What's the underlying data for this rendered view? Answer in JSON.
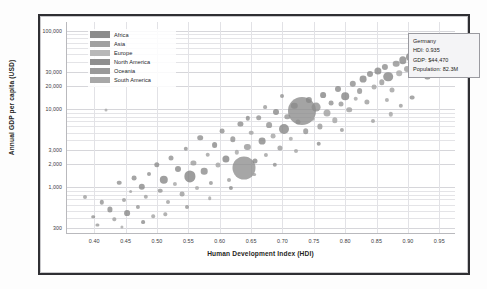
{
  "chart_data": {
    "type": "scatter",
    "title": "",
    "xlabel": "Human Development Index (HDI)",
    "ylabel": "Annual GDP per capita (USD)",
    "xlim": [
      0.355,
      0.975
    ],
    "ylim": [
      260,
      130000
    ],
    "yscale": "log",
    "xscale": "linear",
    "grid": true,
    "legend_position": "top-left-inside",
    "bubble_size_encodes": "Population",
    "xticks": [
      "0.40",
      "0.45",
      "0.50",
      "0.55",
      "0.60",
      "0.65",
      "0.70",
      "0.75",
      "0.80",
      "0.85",
      "0.90",
      "0.95"
    ],
    "xtick_values": [
      0.4,
      0.45,
      0.5,
      0.55,
      0.6,
      0.65,
      0.7,
      0.75,
      0.8,
      0.85,
      0.9,
      0.95
    ],
    "yticks": [
      "300",
      "1,000",
      "2,000",
      "3,000",
      "10,000",
      "20,000",
      "30,000",
      "100,000"
    ],
    "ytick_values": [
      300,
      1000,
      2000,
      3000,
      10000,
      20000,
      30000,
      100000
    ],
    "legend": [
      {
        "label": "Africa",
        "color": "#8c8c8c"
      },
      {
        "label": "Asia",
        "color": "#a0a0a0"
      },
      {
        "label": "Europe",
        "color": "#b8b8b8"
      },
      {
        "label": "North America",
        "color": "#8f8f8f"
      },
      {
        "label": "Oceania",
        "color": "#9a9a9a"
      },
      {
        "label": "South America",
        "color": "#a8a8a8"
      }
    ],
    "annotation": {
      "name": "Germany",
      "hdi_label": "HDI: 0.935",
      "gdp_label": "GDP: $44,470",
      "population_label": "Population: 82.3M",
      "hdi": 0.935,
      "gdp": 44470,
      "population": "82.3M"
    },
    "points": [
      {
        "x": 0.385,
        "y": 740,
        "r": 2.0,
        "c": "#9b9b9b"
      },
      {
        "x": 0.398,
        "y": 420,
        "r": 1.8,
        "c": "#8f8f8f"
      },
      {
        "x": 0.405,
        "y": 330,
        "r": 1.6,
        "c": "#979797"
      },
      {
        "x": 0.412,
        "y": 640,
        "r": 2.2,
        "c": "#909090"
      },
      {
        "x": 0.418,
        "y": 9800,
        "r": 1.5,
        "c": "#a6a6a6"
      },
      {
        "x": 0.425,
        "y": 520,
        "r": 2.6,
        "c": "#8a8a8a"
      },
      {
        "x": 0.432,
        "y": 390,
        "r": 1.7,
        "c": "#9d9d9d"
      },
      {
        "x": 0.44,
        "y": 1150,
        "r": 2.3,
        "c": "#8e8e8e"
      },
      {
        "x": 0.447,
        "y": 680,
        "r": 2.0,
        "c": "#999999"
      },
      {
        "x": 0.452,
        "y": 470,
        "r": 2.9,
        "c": "#858585"
      },
      {
        "x": 0.458,
        "y": 880,
        "r": 1.9,
        "c": "#a2a2a2"
      },
      {
        "x": 0.463,
        "y": 1320,
        "r": 2.4,
        "c": "#8c8c8c"
      },
      {
        "x": 0.47,
        "y": 560,
        "r": 2.1,
        "c": "#949494"
      },
      {
        "x": 0.476,
        "y": 1020,
        "r": 3.2,
        "c": "#888888"
      },
      {
        "x": 0.482,
        "y": 760,
        "r": 2.2,
        "c": "#9e9e9e"
      },
      {
        "x": 0.488,
        "y": 1480,
        "r": 2.0,
        "c": "#8d8d8d"
      },
      {
        "x": 0.494,
        "y": 430,
        "r": 1.8,
        "c": "#a0a0a0"
      },
      {
        "x": 0.5,
        "y": 1950,
        "r": 2.7,
        "c": "#8b8b8b"
      },
      {
        "x": 0.505,
        "y": 900,
        "r": 2.3,
        "c": "#959595"
      },
      {
        "x": 0.511,
        "y": 1250,
        "r": 4.2,
        "c": "#848484"
      },
      {
        "x": 0.517,
        "y": 650,
        "r": 2.0,
        "c": "#9c9c9c"
      },
      {
        "x": 0.523,
        "y": 2400,
        "r": 2.5,
        "c": "#8f8f8f"
      },
      {
        "x": 0.529,
        "y": 1100,
        "r": 2.1,
        "c": "#a3a3a3"
      },
      {
        "x": 0.534,
        "y": 1700,
        "r": 3.0,
        "c": "#878787"
      },
      {
        "x": 0.54,
        "y": 820,
        "r": 2.4,
        "c": "#989898"
      },
      {
        "x": 0.546,
        "y": 3100,
        "r": 2.2,
        "c": "#919191"
      },
      {
        "x": 0.552,
        "y": 1380,
        "r": 5.6,
        "c": "#828282"
      },
      {
        "x": 0.558,
        "y": 2050,
        "r": 2.6,
        "c": "#9a9a9a"
      },
      {
        "x": 0.563,
        "y": 980,
        "r": 2.0,
        "c": "#a5a5a5"
      },
      {
        "x": 0.569,
        "y": 4300,
        "r": 2.8,
        "c": "#8c8c8c"
      },
      {
        "x": 0.575,
        "y": 1600,
        "r": 3.3,
        "c": "#898989"
      },
      {
        "x": 0.581,
        "y": 2600,
        "r": 2.3,
        "c": "#9f9f9f"
      },
      {
        "x": 0.586,
        "y": 1150,
        "r": 2.1,
        "c": "#939393"
      },
      {
        "x": 0.592,
        "y": 3500,
        "r": 2.9,
        "c": "#868686"
      },
      {
        "x": 0.598,
        "y": 1900,
        "r": 2.5,
        "c": "#a1a1a1"
      },
      {
        "x": 0.604,
        "y": 5200,
        "r": 2.4,
        "c": "#8e8e8e"
      },
      {
        "x": 0.61,
        "y": 2300,
        "r": 3.6,
        "c": "#838383"
      },
      {
        "x": 0.615,
        "y": 1250,
        "r": 2.0,
        "c": "#9b9b9b"
      },
      {
        "x": 0.621,
        "y": 4100,
        "r": 2.7,
        "c": "#909090"
      },
      {
        "x": 0.627,
        "y": 2800,
        "r": 2.2,
        "c": "#a4a4a4"
      },
      {
        "x": 0.633,
        "y": 6500,
        "r": 2.6,
        "c": "#8a8a8a"
      },
      {
        "x": 0.638,
        "y": 1750,
        "r": 11.5,
        "c": "#8d8d8d"
      },
      {
        "x": 0.644,
        "y": 3300,
        "r": 3.1,
        "c": "#969696"
      },
      {
        "x": 0.65,
        "y": 5000,
        "r": 2.3,
        "c": "#a0a0a0"
      },
      {
        "x": 0.656,
        "y": 2150,
        "r": 2.5,
        "c": "#888888"
      },
      {
        "x": 0.662,
        "y": 7800,
        "r": 2.8,
        "c": "#929292"
      },
      {
        "x": 0.667,
        "y": 3900,
        "r": 3.4,
        "c": "#858585"
      },
      {
        "x": 0.673,
        "y": 2600,
        "r": 2.1,
        "c": "#9d9d9d"
      },
      {
        "x": 0.679,
        "y": 6200,
        "r": 2.9,
        "c": "#8f8f8f"
      },
      {
        "x": 0.685,
        "y": 4500,
        "r": 2.4,
        "c": "#a2a2a2"
      },
      {
        "x": 0.69,
        "y": 9200,
        "r": 3.0,
        "c": "#878787"
      },
      {
        "x": 0.696,
        "y": 3200,
        "r": 2.6,
        "c": "#999999"
      },
      {
        "x": 0.702,
        "y": 5600,
        "r": 5.0,
        "c": "#848484"
      },
      {
        "x": 0.708,
        "y": 8000,
        "r": 2.7,
        "c": "#949494"
      },
      {
        "x": 0.713,
        "y": 4200,
        "r": 2.2,
        "c": "#a6a6a6"
      },
      {
        "x": 0.719,
        "y": 11000,
        "r": 3.2,
        "c": "#8b8b8b"
      },
      {
        "x": 0.725,
        "y": 6800,
        "r": 2.5,
        "c": "#9e9e9e"
      },
      {
        "x": 0.731,
        "y": 9500,
        "r": 14.0,
        "c": "#8a8a8a"
      },
      {
        "x": 0.737,
        "y": 5200,
        "r": 2.8,
        "c": "#919191"
      },
      {
        "x": 0.742,
        "y": 13000,
        "r": 3.1,
        "c": "#868686"
      },
      {
        "x": 0.748,
        "y": 7500,
        "r": 2.3,
        "c": "#a3a3a3"
      },
      {
        "x": 0.754,
        "y": 10500,
        "r": 4.4,
        "c": "#8d8d8d"
      },
      {
        "x": 0.76,
        "y": 6000,
        "r": 2.6,
        "c": "#979797"
      },
      {
        "x": 0.765,
        "y": 15000,
        "r": 2.9,
        "c": "#838383"
      },
      {
        "x": 0.771,
        "y": 9000,
        "r": 3.5,
        "c": "#9c9c9c"
      },
      {
        "x": 0.777,
        "y": 12000,
        "r": 2.4,
        "c": "#8e8e8e"
      },
      {
        "x": 0.783,
        "y": 7200,
        "r": 2.7,
        "c": "#a1a1a1"
      },
      {
        "x": 0.788,
        "y": 18000,
        "r": 3.0,
        "c": "#888888"
      },
      {
        "x": 0.794,
        "y": 11500,
        "r": 2.5,
        "c": "#959595"
      },
      {
        "x": 0.8,
        "y": 14500,
        "r": 3.8,
        "c": "#828282"
      },
      {
        "x": 0.806,
        "y": 9800,
        "r": 2.8,
        "c": "#9f9f9f"
      },
      {
        "x": 0.812,
        "y": 21000,
        "r": 3.2,
        "c": "#8c8c8c"
      },
      {
        "x": 0.817,
        "y": 13500,
        "r": 2.3,
        "c": "#a4a4a4"
      },
      {
        "x": 0.823,
        "y": 17000,
        "r": 2.9,
        "c": "#909090"
      },
      {
        "x": 0.829,
        "y": 24000,
        "r": 3.4,
        "c": "#858585"
      },
      {
        "x": 0.835,
        "y": 12500,
        "r": 2.6,
        "c": "#9a9a9a"
      },
      {
        "x": 0.84,
        "y": 28000,
        "r": 3.0,
        "c": "#898989"
      },
      {
        "x": 0.846,
        "y": 19000,
        "r": 2.4,
        "c": "#a2a2a2"
      },
      {
        "x": 0.852,
        "y": 31000,
        "r": 3.6,
        "c": "#878787"
      },
      {
        "x": 0.858,
        "y": 22000,
        "r": 2.7,
        "c": "#969696"
      },
      {
        "x": 0.863,
        "y": 35000,
        "r": 3.1,
        "c": "#8b8b8b"
      },
      {
        "x": 0.869,
        "y": 26000,
        "r": 4.8,
        "c": "#838383"
      },
      {
        "x": 0.875,
        "y": 17500,
        "r": 2.5,
        "c": "#9e9e9e"
      },
      {
        "x": 0.881,
        "y": 38000,
        "r": 3.3,
        "c": "#8f8f8f"
      },
      {
        "x": 0.886,
        "y": 29000,
        "r": 2.8,
        "c": "#a5a5a5"
      },
      {
        "x": 0.892,
        "y": 42000,
        "r": 3.7,
        "c": "#868686"
      },
      {
        "x": 0.898,
        "y": 33000,
        "r": 3.0,
        "c": "#999999"
      },
      {
        "x": 0.904,
        "y": 47000,
        "r": 4.0,
        "c": "#848484"
      },
      {
        "x": 0.91,
        "y": 36000,
        "r": 2.9,
        "c": "#939393"
      },
      {
        "x": 0.915,
        "y": 52000,
        "r": 3.4,
        "c": "#8d8d8d"
      },
      {
        "x": 0.921,
        "y": 40000,
        "r": 3.2,
        "c": "#a0a0a0"
      },
      {
        "x": 0.927,
        "y": 58000,
        "r": 3.8,
        "c": "#888888"
      },
      {
        "x": 0.933,
        "y": 45000,
        "r": 5.2,
        "c": "#8a8a8a"
      },
      {
        "x": 0.938,
        "y": 62000,
        "r": 3.1,
        "c": "#929292"
      },
      {
        "x": 0.944,
        "y": 49000,
        "r": 3.5,
        "c": "#858585"
      },
      {
        "x": 0.95,
        "y": 70000,
        "r": 2.8,
        "c": "#9b9b9b"
      },
      {
        "x": 0.955,
        "y": 55000,
        "r": 3.0,
        "c": "#8e8e8e"
      },
      {
        "x": 0.873,
        "y": 8600,
        "r": 2.2,
        "c": "#a1a1a1"
      },
      {
        "x": 0.845,
        "y": 7000,
        "r": 2.0,
        "c": "#9d9d9d"
      },
      {
        "x": 0.795,
        "y": 5400,
        "r": 2.1,
        "c": "#979797"
      },
      {
        "x": 0.758,
        "y": 3600,
        "r": 2.3,
        "c": "#8c8c8c"
      },
      {
        "x": 0.722,
        "y": 2900,
        "r": 2.0,
        "c": "#a3a3a3"
      },
      {
        "x": 0.688,
        "y": 1950,
        "r": 2.2,
        "c": "#919191"
      },
      {
        "x": 0.655,
        "y": 1450,
        "r": 1.9,
        "c": "#9f9f9f"
      },
      {
        "x": 0.618,
        "y": 980,
        "r": 2.1,
        "c": "#8a8a8a"
      },
      {
        "x": 0.584,
        "y": 720,
        "r": 1.8,
        "c": "#a4a4a4"
      },
      {
        "x": 0.548,
        "y": 560,
        "r": 2.0,
        "c": "#949494"
      },
      {
        "x": 0.513,
        "y": 450,
        "r": 1.7,
        "c": "#9c9c9c"
      },
      {
        "x": 0.478,
        "y": 360,
        "r": 1.9,
        "c": "#898989"
      },
      {
        "x": 0.444,
        "y": 310,
        "r": 1.6,
        "c": "#a6a6a6"
      },
      {
        "x": 0.906,
        "y": 14000,
        "r": 2.4,
        "c": "#909090"
      },
      {
        "x": 0.889,
        "y": 11000,
        "r": 2.2,
        "c": "#9a9a9a"
      },
      {
        "x": 0.931,
        "y": 26000,
        "r": 2.6,
        "c": "#878787"
      },
      {
        "x": 0.866,
        "y": 13000,
        "r": 2.1,
        "c": "#a2a2a2"
      },
      {
        "x": 0.7,
        "y": 14500,
        "r": 2.0,
        "c": "#8f8f8f"
      },
      {
        "x": 0.672,
        "y": 10500,
        "r": 1.9,
        "c": "#989898"
      },
      {
        "x": 0.645,
        "y": 7600,
        "r": 2.2,
        "c": "#8b8b8b"
      }
    ],
    "highlight_point": {
      "x": 0.935,
      "y": 44470,
      "r": 5.6,
      "c": "#7a7a7a"
    }
  }
}
